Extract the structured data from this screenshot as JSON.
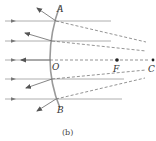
{
  "figure": {
    "caption": "(b)",
    "labels": {
      "A": "A",
      "B": "B",
      "O": "O",
      "F": "F",
      "C": "C"
    },
    "colors": {
      "mirror": "#9a9a9a",
      "ray": "#8a8a8a",
      "arrow": "#555555",
      "dashed": "#666666",
      "point": "#222222"
    }
  }
}
